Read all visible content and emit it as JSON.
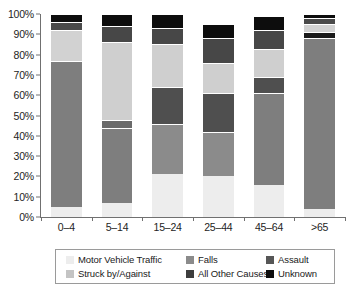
{
  "chart_data": {
    "type": "bar",
    "subtype": "stacked-percentage-column",
    "title": "",
    "xlabel": "",
    "ylabel": "",
    "ylim": [
      0,
      100
    ],
    "y_unit": "%",
    "grid": false,
    "legend_position": "bottom",
    "categories": [
      "0–4",
      "5–14",
      "15–24",
      "25–44",
      "45–64",
      ">65"
    ],
    "y_ticks": [
      "0%",
      "10%",
      "20%",
      "30%",
      "40%",
      "50%",
      "60%",
      "70%",
      "80%",
      "90%",
      "100%"
    ],
    "y_tick_values": [
      0,
      10,
      20,
      30,
      40,
      50,
      60,
      70,
      80,
      90,
      100
    ],
    "stack_order_bottom_to_top": [
      "Motor Vehicle Traffic",
      "Struck by/Against",
      "Falls",
      "All Other Causes",
      "Assault",
      "Unknown"
    ],
    "series": [
      {
        "name": "Motor Vehicle Traffic",
        "color": "#ededed",
        "values": [
          5,
          7,
          21,
          20,
          16,
          4
        ]
      },
      {
        "name": "Struck by/Against",
        "color": "#919191",
        "values": [
          0,
          4,
          25,
          22,
          0,
          0
        ]
      },
      {
        "name": "Falls",
        "color": "#7e7e7e",
        "values": [
          72,
          37,
          0,
          0,
          45,
          84
        ]
      },
      {
        "name": "All Other Causes",
        "color": "#4f4f4f",
        "values": [
          0,
          0,
          17,
          16,
          0,
          0
        ]
      },
      {
        "name": "Assault",
        "color": "#595959",
        "values": [
          4,
          8,
          9,
          12,
          8,
          3
        ]
      },
      {
        "name": "Unknown",
        "color": "#0d0d0d",
        "values": [
          3,
          5,
          6,
          7,
          7,
          2
        ]
      }
    ],
    "bars": [
      {
        "category": "0–4",
        "segments": [
          {
            "name": "Motor Vehicle Traffic",
            "value": 5,
            "color": "#ededed"
          },
          {
            "name": "Falls",
            "value": 72,
            "color": "#7e7e7e"
          },
          {
            "name": "All Other Causes",
            "value": 15,
            "color": "#d2d2d2"
          },
          {
            "name": "Assault",
            "value": 4,
            "color": "#4a4a4a"
          },
          {
            "name": "Unknown",
            "value": 4,
            "color": "#0d0d0d"
          }
        ]
      },
      {
        "category": "5–14",
        "segments": [
          {
            "name": "Motor Vehicle Traffic",
            "value": 7,
            "color": "#ededed"
          },
          {
            "name": "Falls",
            "value": 37,
            "color": "#7e7e7e"
          },
          {
            "name": "Struck by/Against",
            "value": 4,
            "color": "#6a6a6a"
          },
          {
            "name": "All Other Causes",
            "value": 38,
            "color": "#cfcfcf"
          },
          {
            "name": "Assault",
            "value": 8,
            "color": "#474747"
          },
          {
            "name": "Unknown",
            "value": 6,
            "color": "#0d0d0d"
          }
        ]
      },
      {
        "category": "15–24",
        "segments": [
          {
            "name": "Motor Vehicle Traffic",
            "value": 21,
            "color": "#ededed"
          },
          {
            "name": "Struck by/Against",
            "value": 25,
            "color": "#8b8b8b"
          },
          {
            "name": "All Other Causes",
            "value": 18,
            "color": "#4f4f4f"
          },
          {
            "name": "Falls",
            "value": 21,
            "color": "#cfcfcf"
          },
          {
            "name": "Assault",
            "value": 8,
            "color": "#474747"
          },
          {
            "name": "Unknown",
            "value": 7,
            "color": "#0d0d0d"
          }
        ]
      },
      {
        "category": "25–44",
        "segments": [
          {
            "name": "Motor Vehicle Traffic",
            "value": 20,
            "color": "#ededed"
          },
          {
            "name": "Struck by/Against",
            "value": 22,
            "color": "#8b8b8b"
          },
          {
            "name": "All Other Causes",
            "value": 19,
            "color": "#4f4f4f"
          },
          {
            "name": "Falls",
            "value": 15,
            "color": "#cfcfcf"
          },
          {
            "name": "Assault",
            "value": 12,
            "color": "#474747"
          },
          {
            "name": "Unknown",
            "value": 7,
            "color": "#0d0d0d"
          }
        ]
      },
      {
        "category": "45–64",
        "segments": [
          {
            "name": "Motor Vehicle Traffic",
            "value": 16,
            "color": "#ededed"
          },
          {
            "name": "Falls",
            "value": 45,
            "color": "#7e7e7e"
          },
          {
            "name": "All Other Causes",
            "value": 8,
            "color": "#4f4f4f"
          },
          {
            "name": "Struck by/Against",
            "value": 14,
            "color": "#cfcfcf"
          },
          {
            "name": "Assault",
            "value": 9,
            "color": "#474747"
          },
          {
            "name": "Unknown",
            "value": 7,
            "color": "#0d0d0d"
          }
        ]
      },
      {
        "category": ">65",
        "segments": [
          {
            "name": "Motor Vehicle Traffic",
            "value": 4,
            "color": "#ededed"
          },
          {
            "name": "Falls",
            "value": 84,
            "color": "#7e7e7e"
          },
          {
            "name": "All Other Causes",
            "value": 3,
            "color": "#1a1a1a"
          },
          {
            "name": "Struck by/Against",
            "value": 4,
            "color": "#d2d2d2"
          },
          {
            "name": "Assault",
            "value": 3,
            "color": "#4a4a4a"
          },
          {
            "name": "Unknown",
            "value": 2,
            "color": "#0d0d0d"
          }
        ]
      }
    ]
  },
  "legend": {
    "row1": [
      {
        "label": "Motor Vehicle Traffic",
        "color": "#ededed"
      },
      {
        "label": "Falls",
        "color": "#8b8b8b"
      },
      {
        "label": "Assault",
        "color": "#565656"
      }
    ],
    "row2": [
      {
        "label": "Struck by/Against",
        "color": "#c4c4c4"
      },
      {
        "label": "All Other Causes",
        "color": "#3d3d3d"
      },
      {
        "label": "Unknown",
        "color": "#0d0d0d"
      }
    ]
  },
  "axis_colors": {
    "spine": "#707070",
    "tick_text": "#242424",
    "legend_border": "#9a9a9a"
  }
}
